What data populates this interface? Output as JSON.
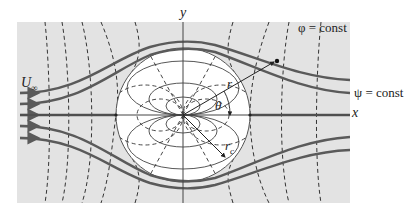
{
  "figure": {
    "labels": {
      "y_axis": "y",
      "x_axis": "x",
      "phi": "φ = const",
      "psi": "ψ = const",
      "freestream": "U",
      "freestream_sub": "∞",
      "radius": "r",
      "theta": "θ",
      "cylinder_radius": "r",
      "cylinder_radius_sub": "c"
    },
    "colors": {
      "background_field": "#e3e3e3",
      "cylinder_fill": "#ffffff",
      "streamline": "#5a5a5a",
      "potential_line": "#333333",
      "axis": "#444444",
      "text": "#222222"
    },
    "geometry": {
      "field_rect": [
        17,
        22,
        333,
        181
      ],
      "center": [
        183,
        115
      ],
      "cylinder_radius_px": 67
    }
  }
}
